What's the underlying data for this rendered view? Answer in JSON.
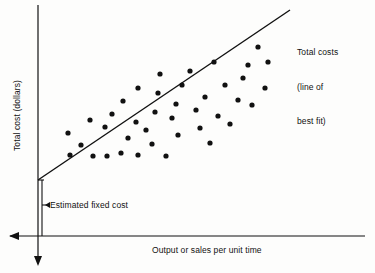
{
  "figure": {
    "background_color": "#fdfdfc",
    "ink_color": "#111111"
  },
  "axes": {
    "y_label": "Total cost (dollars)",
    "x_label": "Output or sales per unit time"
  },
  "annotations": {
    "fixed_cost_label": "Estimated fixed cost",
    "line_label_line1": "Total costs",
    "line_label_line2": "(line of",
    "line_label_line3": "best fit)"
  },
  "chart_data": {
    "type": "scatter",
    "title": "",
    "xlabel": "Output or sales per unit time",
    "ylabel": "Total cost (dollars)",
    "xlim": [
      0,
      100
    ],
    "ylim": [
      0,
      100
    ],
    "grid": false,
    "legend": "none",
    "axis_arrows": {
      "x_axis_arrow_direction": "left",
      "y_axis_arrow_direction": "down"
    },
    "series": [
      {
        "name": "Total costs (observed)",
        "marker": "filled-circle",
        "marker_color": "#111111",
        "points": [
          [
            70,
            155
          ],
          [
            93,
            156
          ],
          [
            107,
            156
          ],
          [
            121,
            153
          ],
          [
            138,
            155
          ],
          [
            68,
            133
          ],
          [
            90,
            120
          ],
          [
            81,
            145
          ],
          [
            105,
            127
          ],
          [
            112,
            114
          ],
          [
            128,
            138
          ],
          [
            123,
            101
          ],
          [
            136,
            122
          ],
          [
            138,
            88
          ],
          [
            146,
            130
          ],
          [
            152,
            144
          ],
          [
            155,
            112
          ],
          [
            158,
            93
          ],
          [
            160,
            74
          ],
          [
            166,
            156
          ],
          [
            172,
            118
          ],
          [
            176,
            104
          ],
          [
            178,
            135
          ],
          [
            182,
            85
          ],
          [
            190,
            71
          ],
          [
            196,
            110
          ],
          [
            200,
            128
          ],
          [
            205,
            97
          ],
          [
            210,
            143
          ],
          [
            214,
            62
          ],
          [
            218,
            116
          ],
          [
            225,
            85
          ],
          [
            230,
            124
          ],
          [
            238,
            100
          ],
          [
            243,
            78
          ],
          [
            248,
            65
          ],
          [
            252,
            105
          ],
          [
            258,
            47
          ],
          [
            265,
            88
          ],
          [
            268,
            62
          ]
        ]
      }
    ],
    "fit_line": {
      "name": "Total costs (line of best fit)",
      "type": "linear",
      "start_pixel": [
        38,
        180
      ],
      "end_pixel": [
        290,
        10
      ],
      "intercept_meaning": "Estimated fixed cost",
      "color": "#111111"
    },
    "fixed_cost_bracket": {
      "x_pixel": 42,
      "y_top_pixel": 180,
      "y_bottom_pixel": 236,
      "tick_y_pixel": 205
    }
  }
}
